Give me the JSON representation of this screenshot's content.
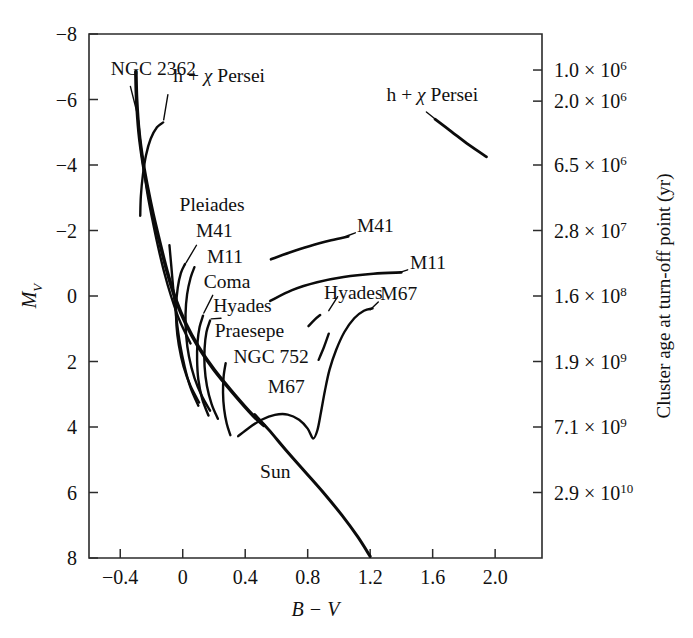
{
  "figure": {
    "kind": "color-magnitude-diagram",
    "background_color": "#ffffff",
    "ink_color": "#0b0b0b"
  },
  "chart_data": {
    "type": "line",
    "title": "",
    "xlabel": "B − V",
    "ylabel": "M_V",
    "y2label": "Cluster age at turn-off point (yr)",
    "grid": false,
    "legend": "none",
    "xlim": [
      -0.6,
      2.3
    ],
    "ylim": [
      -8,
      8
    ],
    "y_inverted": true,
    "xticks": [
      -0.4,
      0,
      0.4,
      0.8,
      1.2,
      1.6,
      2.0
    ],
    "xtick_labels": [
      "−0.4",
      "0",
      "0.4",
      "0.8",
      "1.2",
      "1.6",
      "2.0"
    ],
    "yticks": [
      -8,
      -6,
      -4,
      -2,
      0,
      2,
      4,
      6,
      8
    ],
    "ytick_labels": [
      "−8",
      "−6",
      "−4",
      "−2",
      "0",
      "2",
      "4",
      "6",
      "8"
    ],
    "y2_ticks_mv": [
      -6.9,
      -5.95,
      -4.0,
      -2.0,
      0.0,
      2.0,
      4.0,
      6.0
    ],
    "y2_tick_labels": [
      {
        "mantissa": "1.0",
        "exponent": "6",
        "text": "1.0 × 10⁶"
      },
      {
        "mantissa": "2.0",
        "exponent": "6",
        "text": "2.0 × 10⁶"
      },
      {
        "mantissa": "6.5",
        "exponent": "6",
        "text": "6.5 × 10⁶"
      },
      {
        "mantissa": "2.8",
        "exponent": "7",
        "text": "2.8 × 10⁷"
      },
      {
        "mantissa": "1.6",
        "exponent": "8",
        "text": "1.6 × 10⁸"
      },
      {
        "mantissa": "1.9",
        "exponent": "9",
        "text": "1.9 × 10⁹"
      },
      {
        "mantissa": "7.1",
        "exponent": "9",
        "text": "7.1 × 10⁹"
      },
      {
        "mantissa": "2.9",
        "exponent": "10",
        "text": "2.9 × 10¹⁰"
      }
    ],
    "series": [
      {
        "name": "main-sequence-trunk",
        "width": 3.6,
        "points": [
          [
            -0.3,
            -6.85
          ],
          [
            -0.295,
            -6.0
          ],
          [
            -0.28,
            -5.0
          ],
          [
            -0.255,
            -4.1
          ],
          [
            -0.225,
            -3.3
          ],
          [
            -0.19,
            -2.5
          ],
          [
            -0.145,
            -1.6
          ],
          [
            -0.1,
            -0.75
          ],
          [
            -0.045,
            0.1
          ],
          [
            0.02,
            0.85
          ],
          [
            0.1,
            1.55
          ],
          [
            0.2,
            2.25
          ],
          [
            0.32,
            2.95
          ],
          [
            0.45,
            3.65
          ],
          [
            0.52,
            3.95
          ]
        ]
      },
      {
        "name": "lower-main-sequence-to-sun",
        "width": 3.0,
        "points": [
          [
            0.46,
            3.62
          ],
          [
            0.55,
            4.08
          ],
          [
            0.66,
            4.7
          ],
          [
            0.78,
            5.35
          ],
          [
            0.9,
            6.0
          ],
          [
            1.02,
            6.7
          ],
          [
            1.12,
            7.35
          ],
          [
            1.2,
            7.95
          ]
        ]
      },
      {
        "name": "ngc2362-branch",
        "width": 2.4,
        "points": [
          [
            -0.285,
            -5.35
          ],
          [
            -0.27,
            -4.6
          ],
          [
            -0.25,
            -3.9
          ],
          [
            -0.225,
            -3.1
          ],
          [
            -0.195,
            -2.35
          ],
          [
            -0.16,
            -1.55
          ],
          [
            -0.12,
            -0.75
          ],
          [
            -0.075,
            0.0
          ],
          [
            -0.02,
            0.75
          ],
          [
            0.05,
            1.45
          ]
        ]
      },
      {
        "name": "h-chi-persei-branch",
        "width": 2.4,
        "points": [
          [
            -0.125,
            -5.3
          ],
          [
            -0.165,
            -5.15
          ],
          [
            -0.205,
            -4.8
          ],
          [
            -0.235,
            -4.3
          ],
          [
            -0.255,
            -3.7
          ],
          [
            -0.268,
            -3.05
          ],
          [
            -0.272,
            -2.45
          ]
        ]
      },
      {
        "name": "pleiades-branch",
        "width": 2.4,
        "points": [
          [
            -0.085,
            -1.55
          ],
          [
            -0.072,
            -0.85
          ],
          [
            -0.058,
            -0.1
          ],
          [
            -0.04,
            0.7
          ],
          [
            -0.018,
            1.45
          ],
          [
            0.012,
            2.15
          ],
          [
            0.05,
            2.8
          ],
          [
            0.1,
            3.35
          ]
        ]
      },
      {
        "name": "m41-branch",
        "width": 2.4,
        "points": [
          [
            0.015,
            -0.98
          ],
          [
            -0.012,
            -0.7
          ],
          [
            -0.032,
            -0.25
          ],
          [
            -0.042,
            0.3
          ],
          [
            -0.04,
            0.9
          ],
          [
            -0.025,
            1.5
          ],
          [
            0.005,
            2.15
          ],
          [
            0.05,
            2.75
          ],
          [
            0.105,
            3.25
          ]
        ]
      },
      {
        "name": "m11-branch",
        "width": 2.4,
        "points": [
          [
            0.075,
            -0.88
          ],
          [
            0.05,
            -0.55
          ],
          [
            0.028,
            -0.05
          ],
          [
            0.018,
            0.55
          ],
          [
            0.022,
            1.2
          ],
          [
            0.04,
            1.85
          ],
          [
            0.075,
            2.5
          ],
          [
            0.122,
            3.05
          ],
          [
            0.175,
            3.5
          ]
        ]
      },
      {
        "name": "coma-branch",
        "width": 2.4,
        "points": [
          [
            0.13,
            0.6
          ],
          [
            0.108,
            0.95
          ],
          [
            0.095,
            1.4
          ],
          [
            0.092,
            1.95
          ],
          [
            0.1,
            2.55
          ],
          [
            0.125,
            3.15
          ],
          [
            0.165,
            3.65
          ]
        ]
      },
      {
        "name": "hyades-praesepe-branch",
        "width": 2.4,
        "points": [
          [
            0.175,
            0.75
          ],
          [
            0.152,
            1.1
          ],
          [
            0.14,
            1.6
          ],
          [
            0.14,
            2.15
          ],
          [
            0.155,
            2.75
          ],
          [
            0.185,
            3.3
          ],
          [
            0.225,
            3.75
          ]
        ]
      },
      {
        "name": "ngc752-branch",
        "width": 2.4,
        "points": [
          [
            0.275,
            2.05
          ],
          [
            0.262,
            2.45
          ],
          [
            0.258,
            2.95
          ],
          [
            0.265,
            3.45
          ],
          [
            0.282,
            3.9
          ],
          [
            0.305,
            4.25
          ]
        ]
      },
      {
        "name": "m67-subgiant-branch",
        "width": 2.4,
        "points": [
          [
            0.355,
            4.28
          ],
          [
            0.425,
            4.02
          ],
          [
            0.505,
            3.78
          ],
          [
            0.59,
            3.63
          ],
          [
            0.672,
            3.62
          ],
          [
            0.745,
            3.78
          ],
          [
            0.8,
            4.05
          ],
          [
            0.835,
            4.35
          ],
          [
            0.862,
            4.1
          ],
          [
            0.885,
            3.55
          ],
          [
            0.91,
            2.9
          ],
          [
            0.94,
            2.25
          ],
          [
            0.982,
            1.65
          ],
          [
            1.035,
            1.1
          ],
          [
            1.098,
            0.68
          ],
          [
            1.16,
            0.45
          ],
          [
            1.215,
            0.38
          ]
        ]
      },
      {
        "name": "m67-giant-upper",
        "width": 2.4,
        "points": [
          [
            0.87,
            1.95
          ],
          [
            0.905,
            1.55
          ],
          [
            0.935,
            1.15
          ]
        ]
      },
      {
        "name": "hyades-giant-clump",
        "width": 2.4,
        "points": [
          [
            0.805,
            0.92
          ],
          [
            0.845,
            0.72
          ],
          [
            0.88,
            0.58
          ]
        ]
      },
      {
        "name": "m11-giant-branch",
        "width": 2.6,
        "points": [
          [
            0.56,
            0.15
          ],
          [
            0.7,
            -0.18
          ],
          [
            0.86,
            -0.42
          ],
          [
            1.03,
            -0.58
          ],
          [
            1.22,
            -0.68
          ],
          [
            1.4,
            -0.72
          ]
        ]
      },
      {
        "name": "m41-giant-branch",
        "width": 2.6,
        "points": [
          [
            0.565,
            -1.12
          ],
          [
            0.68,
            -1.32
          ],
          [
            0.81,
            -1.52
          ],
          [
            0.95,
            -1.7
          ],
          [
            1.06,
            -1.82
          ]
        ]
      },
      {
        "name": "h-chi-persei-supergiants",
        "width": 2.8,
        "points": [
          [
            1.615,
            -5.4
          ],
          [
            1.72,
            -5.02
          ],
          [
            1.83,
            -4.62
          ],
          [
            1.945,
            -4.25
          ]
        ]
      }
    ],
    "annotations": [
      {
        "name": "ngc-2362",
        "text": "NGC 2362",
        "x": -0.46,
        "y": -6.75,
        "anchor": "start"
      },
      {
        "name": "h-chi-persei-top",
        "text": "h + χ Persei",
        "x": -0.06,
        "y": -6.52,
        "anchor": "start",
        "has_chi": true
      },
      {
        "name": "pleiades",
        "text": "Pleiades",
        "x": -0.02,
        "y": -2.6,
        "anchor": "start"
      },
      {
        "name": "m41",
        "text": "M41",
        "x": 0.085,
        "y": -1.8,
        "anchor": "start"
      },
      {
        "name": "m11",
        "text": "M11",
        "x": 0.155,
        "y": -1.0,
        "anchor": "start"
      },
      {
        "name": "coma",
        "text": "Coma",
        "x": 0.135,
        "y": -0.25,
        "anchor": "start"
      },
      {
        "name": "hyades-ms",
        "text": "Hyades",
        "x": 0.195,
        "y": 0.48,
        "anchor": "start"
      },
      {
        "name": "praesepe",
        "text": "Praesepe",
        "x": 0.205,
        "y": 1.25,
        "anchor": "start"
      },
      {
        "name": "ngc-752",
        "text": "NGC 752",
        "x": 0.325,
        "y": 2.05,
        "anchor": "start"
      },
      {
        "name": "m67-lower",
        "text": "M67",
        "x": 0.545,
        "y": 2.95,
        "anchor": "start"
      },
      {
        "name": "sun",
        "text": "Sun",
        "x": 0.495,
        "y": 5.55,
        "anchor": "start"
      },
      {
        "name": "hyades-giant",
        "text": "Hyades",
        "x": 0.905,
        "y": 0.1,
        "anchor": "start"
      },
      {
        "name": "m67-giant",
        "text": "M67",
        "x": 1.265,
        "y": 0.12,
        "anchor": "start"
      },
      {
        "name": "m11-giant",
        "text": "M11",
        "x": 1.455,
        "y": -0.82,
        "anchor": "start"
      },
      {
        "name": "m41-giant",
        "text": "M41",
        "x": 1.115,
        "y": -1.95,
        "anchor": "start"
      },
      {
        "name": "h-chi-persei-sg",
        "text": "h + χ Persei",
        "x": 1.305,
        "y": -5.95,
        "anchor": "start",
        "has_chi": true
      }
    ],
    "leaders": [
      {
        "name": "ngc-2362-leader",
        "from": [
          -0.335,
          -6.4
        ],
        "to": [
          -0.285,
          -5.45
        ]
      },
      {
        "name": "h-chi-persei-leader",
        "from": [
          -0.095,
          -6.15
        ],
        "to": [
          -0.122,
          -5.38
        ]
      },
      {
        "name": "m41-leader",
        "from": [
          0.088,
          -1.55
        ],
        "to": [
          0.022,
          -1.02
        ]
      },
      {
        "name": "coma-leader",
        "from": [
          0.192,
          -0.02
        ],
        "to": [
          0.135,
          0.52
        ]
      },
      {
        "name": "hyades-leader",
        "from": [
          0.245,
          0.68
        ],
        "to": [
          0.182,
          0.7
        ]
      },
      {
        "name": "hyades-giant-leader",
        "from": [
          0.935,
          0.45
        ],
        "to": [
          0.992,
          0.02
        ]
      },
      {
        "name": "m67-giant-leader",
        "from": [
          1.2,
          0.42
        ],
        "to": [
          1.252,
          0.18
        ]
      },
      {
        "name": "m11-giant-leader",
        "from": [
          1.39,
          -0.72
        ],
        "to": [
          1.44,
          -0.8
        ]
      },
      {
        "name": "m41-giant-leader",
        "from": [
          1.055,
          -1.84
        ],
        "to": [
          1.105,
          -1.93
        ]
      },
      {
        "name": "h-chi-persei-sg-leader",
        "from": [
          1.56,
          -5.62
        ],
        "to": [
          1.612,
          -5.42
        ]
      }
    ]
  }
}
